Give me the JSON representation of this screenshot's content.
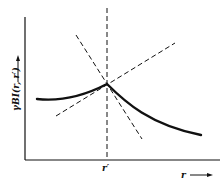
{
  "diagram": {
    "type": "function-plot-sketch",
    "y_axis_label": "γBI(r, r′)",
    "x_axis_label": "r",
    "x_tick_label": "r′",
    "elements": [
      {
        "name": "curve",
        "style": "solid-thick",
        "description": "function with peak (cusp) at r = r′"
      },
      {
        "name": "vertical-line",
        "style": "dashed",
        "at": "r′"
      },
      {
        "name": "tangent-left",
        "style": "dashed",
        "description": "rising tangent through the cusp"
      },
      {
        "name": "tangent-right",
        "style": "dashed",
        "description": "falling tangent through the cusp"
      }
    ],
    "colors": {
      "ink": "#111111",
      "background": "#ffffff"
    }
  }
}
